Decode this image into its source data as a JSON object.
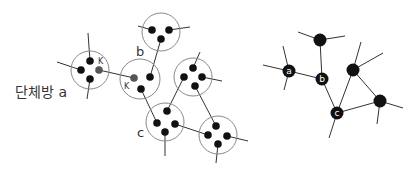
{
  "left_diagram": {
    "room_label": "단체방 a",
    "labels": {
      "b": "b",
      "c": "c",
      "k1": "K",
      "k2": "K"
    },
    "colors": {
      "dot": "#111111",
      "shared_dot": "#555555",
      "ring": "#888888",
      "line": "#333333"
    }
  },
  "right_diagram": {
    "nodes": [
      {
        "id": "a",
        "label": "a"
      },
      {
        "id": "b",
        "label": "b"
      },
      {
        "id": "c",
        "label": "c"
      },
      {
        "id": "top",
        "label": ""
      },
      {
        "id": "upper-right",
        "label": ""
      },
      {
        "id": "lower-right",
        "label": ""
      }
    ],
    "colors": {
      "node": "#111111",
      "line": "#333333",
      "label": "#ffffff"
    }
  }
}
